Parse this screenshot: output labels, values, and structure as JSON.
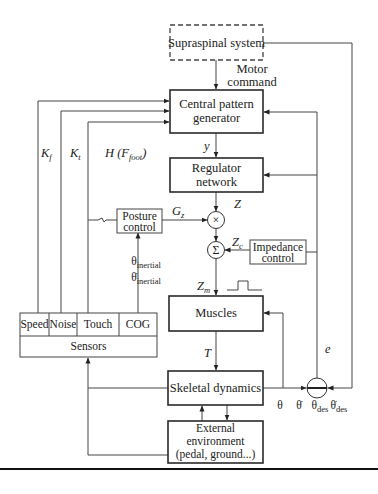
{
  "diagram": {
    "blocks": {
      "supraspinal": "Supraspinal system",
      "cpg_line1": "Central pattern",
      "cpg_line2": "generator",
      "regulator_line1": "Regulator",
      "regulator_line2": "network",
      "posture_line1": "Posture",
      "posture_line2": "control",
      "impedance_line1": "Impedance",
      "impedance_line2": "control",
      "muscles": "Muscles",
      "skeletal": "Skeletal dynamics",
      "external_line1": "External",
      "external_line2": "environment",
      "external_line3": "(pedal, ground...)",
      "sensors": "Sensors"
    },
    "sensor_cells": [
      "Speed",
      "Noise",
      "Touch",
      "COG"
    ],
    "operators": {
      "multiply": "×",
      "sum": "Σ"
    },
    "signals": {
      "motor_command_line1": "Motor",
      "motor_command_line2": "command",
      "y": "y",
      "z": "Z",
      "gz": "G",
      "gz_sub": "z",
      "zc": "Z",
      "zc_sub": "c",
      "zm": "Z",
      "zm_sub": "m",
      "t": "T",
      "e": "e",
      "kf": "K",
      "kf_sub": "f",
      "kt": "K",
      "kt_sub": "t",
      "h": "H (F",
      "h_sub": "foot",
      "h_close": ")",
      "theta_inertial": "θ",
      "theta_inertial_sub": "inertial",
      "theta_dot_inertial": "θ̇",
      "theta_dot_inertial_sub": "inertial",
      "theta": "θ",
      "theta_dot": "θ̇",
      "theta_des": "θ",
      "theta_des_sub": "des",
      "theta_dot_des": "θ̇",
      "theta_dot_des_sub": "des"
    }
  }
}
